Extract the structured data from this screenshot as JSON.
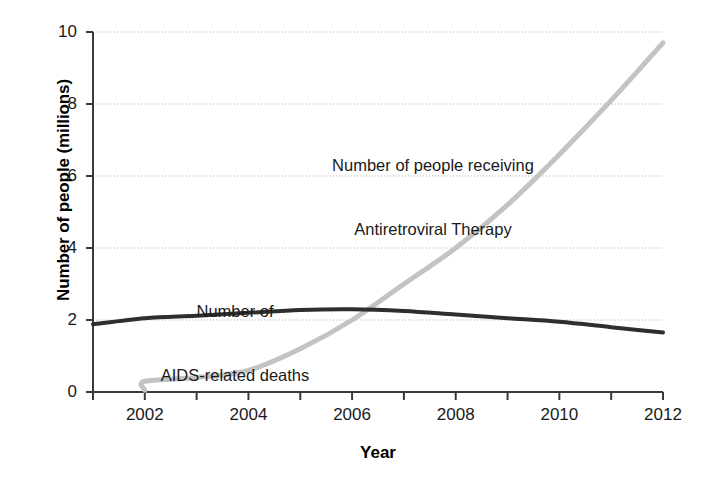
{
  "chart_data": {
    "type": "line",
    "title": "",
    "xlabel": "Year",
    "ylabel": "Number of people (millions)",
    "xlim": [
      2001,
      2012
    ],
    "ylim": [
      0,
      10
    ],
    "grid": true,
    "grid_axis": "y",
    "legend_position": "inline-annotations",
    "xticks": [
      2001,
      2002,
      2003,
      2004,
      2005,
      2006,
      2007,
      2008,
      2009,
      2010,
      2011,
      2012
    ],
    "xtick_labels": [
      "",
      "2002",
      "",
      "2004",
      "",
      "2006",
      "",
      "2008",
      "",
      "2010",
      "",
      "2012"
    ],
    "yticks": [
      0,
      2,
      4,
      6,
      8,
      10
    ],
    "ytick_labels": [
      "0",
      "2",
      "4",
      "6",
      "8",
      "10"
    ],
    "series": [
      {
        "name": "Number of people receiving Antiretroviral Therapy",
        "color": "#c3c3c3",
        "x": [
          2002,
          2002,
          2003,
          2004,
          2005,
          2006,
          2007,
          2008,
          2009,
          2010,
          2011,
          2012
        ],
        "values": [
          0.05,
          0.3,
          0.4,
          0.6,
          1.2,
          2.0,
          3.0,
          4.0,
          5.2,
          6.6,
          8.1,
          9.7
        ]
      },
      {
        "name": "Number of AIDS-related deaths",
        "color": "#2e2e2e",
        "x": [
          2001,
          2002,
          2003,
          2004,
          2005,
          2006,
          2007,
          2008,
          2009,
          2010,
          2011,
          2012
        ],
        "values": [
          1.88,
          2.05,
          2.12,
          2.2,
          2.28,
          2.3,
          2.25,
          2.15,
          2.05,
          1.95,
          1.8,
          1.65
        ]
      }
    ],
    "annotations": [
      {
        "name": "art-annotation",
        "line1": "Number of people receiving",
        "line2": "Antiretroviral Therapy"
      },
      {
        "name": "deaths-annotation",
        "line1": "Number of",
        "line2": "AIDS-related deaths"
      }
    ]
  },
  "axes": {
    "xlabel": "Year",
    "ylabel": "Number of people (millions)"
  },
  "annotations": {
    "art": {
      "line1": "Number of people receiving",
      "line2": "Antiretroviral Therapy"
    },
    "deaths": {
      "line1": "Number of",
      "line2": "AIDS-related deaths"
    }
  },
  "colors": {
    "art_line": "#c3c3c3",
    "deaths_line": "#2e2e2e",
    "axis": "#3a3a3a",
    "grid": "#aaaaaa",
    "text": "#1a1a1a",
    "background": "#ffffff"
  }
}
